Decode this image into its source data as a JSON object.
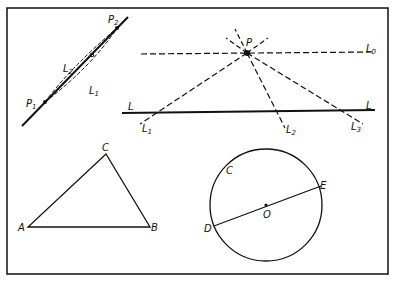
{
  "figure": {
    "frame": {
      "x": 7,
      "y": 8,
      "w": 381,
      "h": 266
    },
    "colors": {
      "ink": "#111111",
      "background": "#ffffff"
    },
    "panel_line_segment": {
      "solid_line": {
        "x1": 22,
        "y1": 126,
        "x2": 128,
        "y2": 17
      },
      "points": [
        {
          "label": "P1",
          "display": "P",
          "sub": "1",
          "x": 45,
          "y": 102
        },
        {
          "label": "P2",
          "display": "P",
          "sub": "2",
          "x": 117,
          "y": 28
        }
      ],
      "curves": [
        {
          "label": "L2",
          "display": "L",
          "sub": "2"
        },
        {
          "label": "L1",
          "display": "L",
          "sub": "1"
        }
      ]
    },
    "panel_pencil_of_lines": {
      "point": {
        "label": "P",
        "x": 247,
        "y": 53
      },
      "line_L": {
        "label": "L",
        "x1": 122,
        "y1": 113,
        "x2": 375,
        "y2": 110
      },
      "dashed_lines": [
        {
          "label": "L0",
          "display": "L",
          "sub": "0"
        },
        {
          "label": "L1",
          "display": "L",
          "sub": "1"
        },
        {
          "label": "L2",
          "display": "L",
          "sub": "2"
        },
        {
          "label": "L3",
          "display": "L",
          "sub": "3"
        }
      ]
    },
    "panel_triangle": {
      "vertices": [
        {
          "label": "A",
          "x": 28,
          "y": 227
        },
        {
          "label": "B",
          "x": 150,
          "y": 227
        },
        {
          "label": "C",
          "x": 106,
          "y": 154
        }
      ]
    },
    "panel_circle": {
      "center": {
        "label": "O",
        "x": 266,
        "y": 205
      },
      "radius": 56,
      "points": [
        {
          "label": "C"
        },
        {
          "label": "D"
        },
        {
          "label": "E"
        }
      ],
      "diameter": "DE"
    }
  }
}
